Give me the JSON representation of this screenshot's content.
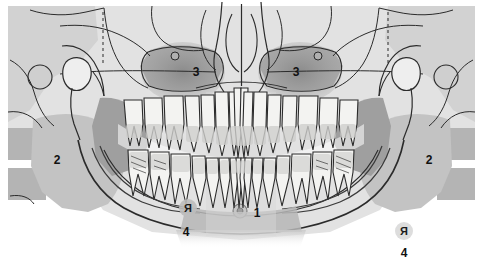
{
  "figure": {
    "type": "panoramic-dental-radiograph-diagram",
    "background_color": "#ffffff",
    "tone_light": "#e3e3e3",
    "tone_mid": "#c9c9c9",
    "tone_dark": "#a8a8a8",
    "tone_darker": "#8f8f8f",
    "tooth_fill": "#f2f2f0",
    "line_color": "#2b2b2b"
  },
  "labels": [
    {
      "id": "label-1",
      "text": "1",
      "x": 257,
      "y": 217,
      "meaning": "mental-foramen"
    },
    {
      "id": "label-2-left",
      "text": "2",
      "x": 57,
      "y": 164,
      "meaning": "ramus-of-mandible-left"
    },
    {
      "id": "label-2-right",
      "text": "2",
      "x": 429,
      "y": 164,
      "meaning": "ramus-of-mandible-right"
    },
    {
      "id": "label-3-left",
      "text": "3",
      "x": 196,
      "y": 76,
      "meaning": "maxillary-sinus-left"
    },
    {
      "id": "label-3-right",
      "text": "3",
      "x": 296,
      "y": 76,
      "meaning": "maxillary-sinus-right"
    },
    {
      "id": "label-4-center",
      "text": "4",
      "x": 186,
      "y": 236,
      "meaning": "side-marker-caption-center"
    },
    {
      "id": "label-4-right",
      "text": "4",
      "x": 404,
      "y": 257,
      "meaning": "side-marker-caption-right"
    }
  ],
  "markers": [
    {
      "id": "marker-r-center",
      "text": "Я",
      "x": 188,
      "y": 212,
      "meaning": "right-side-marker"
    },
    {
      "id": "marker-r-right",
      "text": "Я",
      "x": 404,
      "y": 235,
      "meaning": "right-side-marker-duplicate"
    }
  ],
  "landmarks": {
    "mental_foramen": {
      "cx": 240,
      "cy": 211,
      "r": 6
    },
    "infraorbital_foramen_left": {
      "cx": 175,
      "cy": 56,
      "r": 4
    },
    "infraorbital_foramen_right": {
      "cx": 318,
      "cy": 56,
      "r": 4
    },
    "external_auditory_meatus_left": {
      "cx": 40,
      "cy": 77,
      "r": 12
    },
    "external_auditory_meatus_right": {
      "cx": 446,
      "cy": 77,
      "r": 12
    }
  },
  "guides": {
    "dashed_line_left": {
      "x": 103,
      "y1": 12,
      "y2": 63
    },
    "dashed_line_right": {
      "x": 388,
      "y1": 12,
      "y2": 63
    }
  },
  "dentition": {
    "upper_teeth_count": 16,
    "lower_teeth_count": 16,
    "note": "full permanent dentition, maxillary arch above occlusal plane, mandibular arch below"
  }
}
